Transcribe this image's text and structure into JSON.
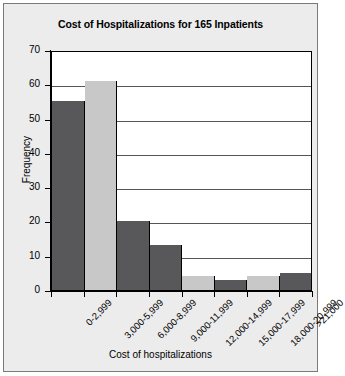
{
  "chart_data": {
    "type": "bar",
    "title": "Cost of Hospitalizations for 165 Inpatients",
    "xlabel": "Cost of hospitalizations",
    "ylabel": "Frequency",
    "categories": [
      "0-2,999",
      "3,000-5,999",
      "6,000-8,999",
      "9,000-11,999",
      "12,000-14,999",
      "15,000-17,999",
      "18,000-20,999",
      ">21,000"
    ],
    "values": [
      55,
      61,
      20,
      13,
      4,
      3,
      4,
      5
    ],
    "bar_colors": [
      "#58585a",
      "#c8c8c8",
      "#58585a",
      "#58585a",
      "#c8c8c8",
      "#58585a",
      "#c8c8c8",
      "#58585a"
    ],
    "ylim": [
      0,
      70
    ],
    "ytick_values": [
      0,
      10,
      20,
      30,
      40,
      50,
      60,
      70
    ],
    "ytick_labels": [
      "0",
      "10",
      "20",
      "30",
      "40",
      "50",
      "60",
      "70"
    ],
    "grid": "horizontal",
    "legend": "none",
    "plot_background": "#ffffff",
    "figure_background": "#ececec",
    "axis_color": "#000000",
    "gridline_color": "#555555"
  }
}
